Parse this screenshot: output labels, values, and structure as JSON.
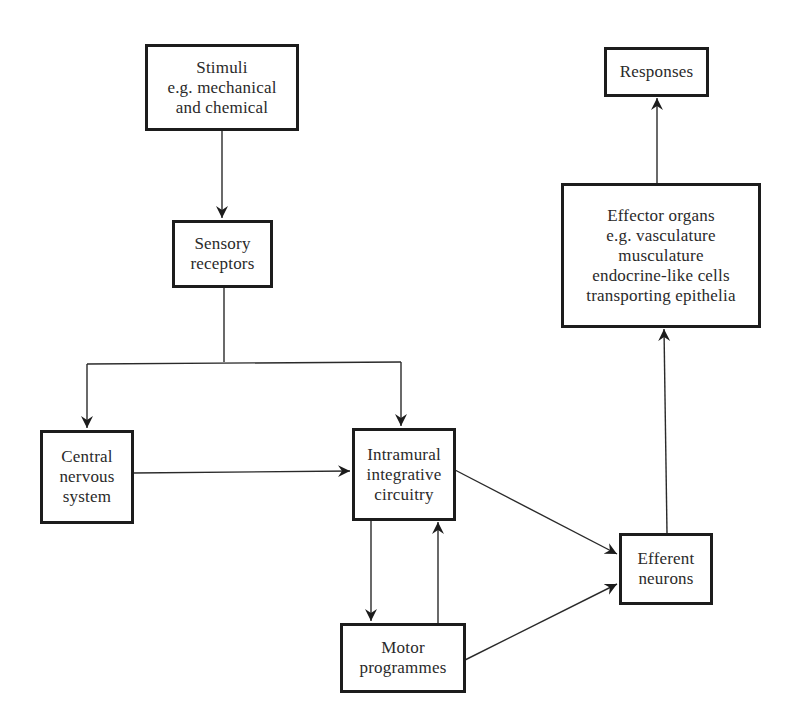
{
  "diagram": {
    "type": "flowchart",
    "nodes": [
      {
        "id": "stimuli",
        "lines": [
          "Stimuli",
          "e.g. mechanical",
          "and chemical"
        ]
      },
      {
        "id": "sensory_receptors",
        "lines": [
          "Sensory",
          "receptors"
        ]
      },
      {
        "id": "central_nervous_system",
        "lines": [
          "Central",
          "nervous",
          "system"
        ]
      },
      {
        "id": "intramural_integrative_circuitry",
        "lines": [
          "Intramural",
          "integrative",
          "circuitry"
        ]
      },
      {
        "id": "motor_programmes",
        "lines": [
          "Motor",
          "programmes"
        ]
      },
      {
        "id": "efferent_neurons",
        "lines": [
          "Efferent",
          "neurons"
        ]
      },
      {
        "id": "effector_organs",
        "lines": [
          "Effector organs",
          "e.g. vasculature",
          "musculature",
          "endocrine-like cells",
          "transporting epithelia"
        ]
      },
      {
        "id": "responses",
        "lines": [
          "Responses"
        ]
      }
    ],
    "edges": [
      {
        "from": "stimuli",
        "to": "sensory_receptors"
      },
      {
        "from": "sensory_receptors",
        "to": "central_nervous_system"
      },
      {
        "from": "sensory_receptors",
        "to": "intramural_integrative_circuitry"
      },
      {
        "from": "central_nervous_system",
        "to": "intramural_integrative_circuitry"
      },
      {
        "from": "intramural_integrative_circuitry",
        "to": "motor_programmes"
      },
      {
        "from": "motor_programmes",
        "to": "intramural_integrative_circuitry"
      },
      {
        "from": "intramural_integrative_circuitry",
        "to": "efferent_neurons"
      },
      {
        "from": "motor_programmes",
        "to": "efferent_neurons"
      },
      {
        "from": "efferent_neurons",
        "to": "effector_organs"
      },
      {
        "from": "effector_organs",
        "to": "responses"
      }
    ]
  }
}
